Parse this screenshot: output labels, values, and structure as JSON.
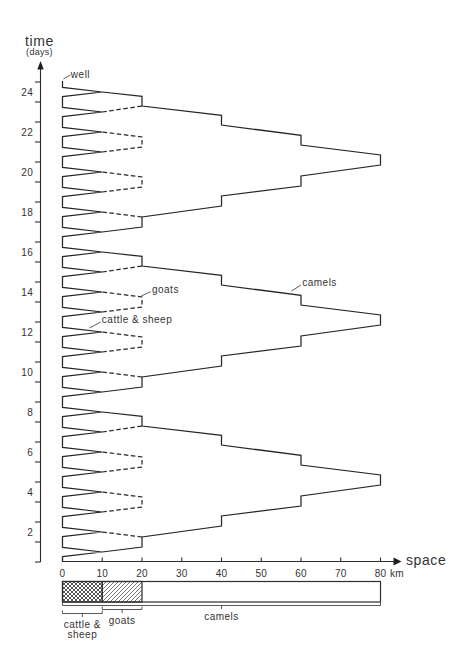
{
  "chart_data": {
    "type": "line",
    "title": "",
    "xlabel": "space",
    "xunit": "km",
    "ylabel": "time",
    "yunit": "(days)",
    "xlim": [
      0,
      80
    ],
    "ylim": [
      0,
      24
    ],
    "grid": false,
    "legend": false,
    "x_ticks": [
      0,
      10,
      20,
      30,
      40,
      50,
      60,
      70,
      80
    ],
    "x_tick_labels": [
      "0",
      "10",
      "20",
      "30",
      "40",
      "50",
      "60",
      "70",
      "80"
    ],
    "y_ticks": [
      0,
      1,
      2,
      3,
      4,
      5,
      6,
      7,
      8,
      9,
      10,
      11,
      12,
      13,
      14,
      15,
      16,
      17,
      18,
      19,
      20,
      21,
      22,
      23,
      24
    ],
    "y_tick_labels": [
      {
        "day": 2,
        "label": "2"
      },
      {
        "day": 4,
        "label": "4"
      },
      {
        "day": 6,
        "label": "6"
      },
      {
        "day": 8,
        "label": "8"
      },
      {
        "day": 10,
        "label": "10"
      },
      {
        "day": 12,
        "label": "12"
      },
      {
        "day": 14,
        "label": "14"
      },
      {
        "day": 16,
        "label": "16"
      },
      {
        "day": 18,
        "label": "18"
      },
      {
        "day": 20,
        "label": "20"
      },
      {
        "day": 22,
        "label": "22"
      },
      {
        "day": 24,
        "label": "24"
      }
    ],
    "series": [
      {
        "name": "cattle & sheep",
        "style": "solid",
        "point_format": "[km, day]",
        "segments": [
          [
            [
              0,
              0
            ],
            [
              0,
              0.27
            ],
            [
              10,
              0.5
            ],
            [
              0,
              0.73
            ],
            [
              0,
              1.27
            ],
            [
              10,
              1.5
            ],
            [
              0,
              1.73
            ],
            [
              0,
              2.27
            ],
            [
              10,
              2.5
            ],
            [
              0,
              2.73
            ],
            [
              0,
              3.27
            ],
            [
              10,
              3.5
            ],
            [
              0,
              3.73
            ],
            [
              0,
              4.27
            ],
            [
              10,
              4.5
            ],
            [
              0,
              4.73
            ],
            [
              0,
              5.27
            ],
            [
              10,
              5.5
            ],
            [
              0,
              5.73
            ],
            [
              0,
              6.27
            ],
            [
              10,
              6.5
            ],
            [
              0,
              6.73
            ],
            [
              0,
              7.27
            ],
            [
              10,
              7.5
            ],
            [
              0,
              7.73
            ],
            [
              0,
              8.27
            ],
            [
              10,
              8.5
            ],
            [
              0,
              8.73
            ],
            [
              0,
              9.27
            ],
            [
              10,
              9.5
            ],
            [
              0,
              9.73
            ],
            [
              0,
              10.27
            ],
            [
              10,
              10.5
            ],
            [
              0,
              10.73
            ],
            [
              0,
              11.27
            ],
            [
              10,
              11.5
            ],
            [
              0,
              11.73
            ],
            [
              0,
              12.27
            ],
            [
              10,
              12.5
            ],
            [
              0,
              12.73
            ],
            [
              0,
              13.27
            ],
            [
              10,
              13.5
            ],
            [
              0,
              13.73
            ],
            [
              0,
              14.27
            ],
            [
              10,
              14.5
            ],
            [
              0,
              14.73
            ],
            [
              0,
              15.27
            ],
            [
              10,
              15.5
            ],
            [
              0,
              15.73
            ],
            [
              0,
              16.27
            ],
            [
              10,
              16.5
            ],
            [
              0,
              16.73
            ],
            [
              0,
              17.27
            ],
            [
              10,
              17.5
            ],
            [
              0,
              17.73
            ],
            [
              0,
              18.27
            ],
            [
              10,
              18.5
            ],
            [
              0,
              18.73
            ],
            [
              0,
              19.27
            ],
            [
              10,
              19.5
            ],
            [
              0,
              19.73
            ],
            [
              0,
              20.27
            ],
            [
              10,
              20.5
            ],
            [
              0,
              20.73
            ],
            [
              0,
              21.27
            ],
            [
              10,
              21.5
            ],
            [
              0,
              21.73
            ],
            [
              0,
              22.27
            ],
            [
              10,
              22.5
            ],
            [
              0,
              22.73
            ],
            [
              0,
              23.27
            ],
            [
              10,
              23.5
            ],
            [
              0,
              23.73
            ],
            [
              0,
              24.05
            ]
          ]
        ]
      },
      {
        "name": "goats",
        "style": "dashed",
        "point_format": "[km, day]",
        "segments": [
          [
            [
              20,
              1.25
            ],
            [
              10,
              1.5
            ]
          ],
          [
            [
              10,
              2.5
            ],
            [
              20,
              2.75
            ],
            [
              20,
              3.25
            ],
            [
              10,
              3.5
            ]
          ],
          [
            [
              10,
              4.5
            ],
            [
              20,
              4.75
            ],
            [
              20,
              5.25
            ],
            [
              10,
              5.5
            ]
          ],
          [
            [
              10,
              6.5
            ],
            [
              20,
              6.8
            ]
          ],
          [
            [
              20,
              9.25
            ],
            [
              10,
              9.5
            ]
          ],
          [
            [
              10,
              10.5
            ],
            [
              20,
              10.75
            ],
            [
              20,
              11.25
            ],
            [
              10,
              11.5
            ]
          ],
          [
            [
              10,
              12.5
            ],
            [
              20,
              12.75
            ],
            [
              20,
              13.25
            ],
            [
              10,
              13.5
            ]
          ],
          [
            [
              10,
              14.5
            ],
            [
              20,
              14.8
            ]
          ],
          [
            [
              20,
              17.25
            ],
            [
              10,
              17.5
            ]
          ],
          [
            [
              10,
              18.5
            ],
            [
              20,
              18.75
            ],
            [
              20,
              19.25
            ],
            [
              10,
              19.5
            ]
          ],
          [
            [
              10,
              20.5
            ],
            [
              20,
              20.75
            ],
            [
              20,
              21.25
            ],
            [
              10,
              21.5
            ]
          ],
          [
            [
              10,
              22.5
            ],
            [
              20,
              22.8
            ]
          ]
        ]
      },
      {
        "name": "camels",
        "style": "solid",
        "point_format": "[km, day]",
        "segments": [
          [
            [
              10,
              0.5
            ],
            [
              20,
              0.75
            ],
            [
              20,
              1.25
            ],
            [
              40,
              1.8
            ],
            [
              40,
              2.3
            ],
            [
              60,
              2.8
            ],
            [
              60,
              3.3
            ],
            [
              80,
              3.85
            ],
            [
              80,
              4.35
            ],
            [
              60,
              4.85
            ],
            [
              60,
              5.33
            ],
            [
              40,
              5.85
            ],
            [
              40,
              6.33
            ],
            [
              20,
              6.8
            ],
            [
              20,
              7.28
            ],
            [
              10,
              7.5
            ]
          ],
          [
            [
              10,
              8.5
            ],
            [
              20,
              8.75
            ],
            [
              20,
              9.25
            ],
            [
              40,
              9.8
            ],
            [
              40,
              10.3
            ],
            [
              60,
              10.8
            ],
            [
              60,
              11.3
            ],
            [
              80,
              11.85
            ],
            [
              80,
              12.35
            ],
            [
              60,
              12.85
            ],
            [
              60,
              13.33
            ],
            [
              40,
              13.85
            ],
            [
              40,
              14.33
            ],
            [
              20,
              14.8
            ],
            [
              20,
              15.28
            ],
            [
              10,
              15.5
            ]
          ],
          [
            [
              10,
              16.5
            ],
            [
              20,
              16.75
            ],
            [
              20,
              17.25
            ],
            [
              40,
              17.8
            ],
            [
              40,
              18.3
            ],
            [
              60,
              18.8
            ],
            [
              60,
              19.3
            ],
            [
              80,
              19.85
            ],
            [
              80,
              20.35
            ],
            [
              60,
              20.85
            ],
            [
              60,
              21.33
            ],
            [
              40,
              21.85
            ],
            [
              40,
              22.33
            ],
            [
              20,
              22.8
            ],
            [
              20,
              23.28
            ],
            [
              10,
              23.5
            ]
          ]
        ]
      }
    ],
    "annotations": [
      {
        "text": "well",
        "leader": [
          [
            0.2,
            24.15
          ],
          [
            2.0,
            24.35
          ]
        ],
        "at": [
          2.1,
          24.4
        ]
      },
      {
        "text": "goats",
        "leader": [
          [
            19.8,
            13.3
          ],
          [
            22.2,
            13.52
          ]
        ],
        "at": [
          22.5,
          13.65
        ]
      },
      {
        "text": "cattle & sheep",
        "leader": [
          [
            6.8,
            11.7
          ],
          [
            9.6,
            12.0
          ]
        ],
        "at": [
          9.9,
          12.14
        ]
      },
      {
        "text": "camels",
        "leader": [
          [
            57.6,
            13.55
          ],
          [
            60.0,
            13.85
          ]
        ],
        "at": [
          60.3,
          13.97
        ]
      }
    ],
    "range_bar": {
      "segments": [
        {
          "label": "camels",
          "label_lines": [
            "camels"
          ],
          "from": 0,
          "to": 80,
          "fill": "none",
          "bracket_row": 0
        },
        {
          "label": "goats",
          "label_lines": [
            "goats"
          ],
          "from": 10,
          "to": 20,
          "fill": "diagonal-hatch",
          "bracket_row": 1
        },
        {
          "label": "cattle & sheep",
          "label_lines": [
            "cattle &",
            "sheep"
          ],
          "from": 0,
          "to": 10,
          "fill": "crosshatch",
          "bracket_row": 2
        }
      ]
    }
  }
}
